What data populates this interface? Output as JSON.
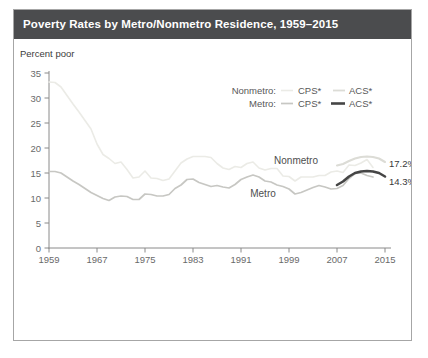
{
  "window": {
    "title": "Poverty Rates by Metro/Nonmetro Residence, 1959–2015"
  },
  "chart": {
    "y_axis_title": "Percent poor",
    "legend": {
      "row1_label": "Nonmetro:",
      "row1_cps": "CPS*",
      "row1_acs": "ACS*",
      "row2_label": "Metro:",
      "row2_cps": "CPS*",
      "row2_acs": "ACS*"
    },
    "annotations": {
      "nonmetro": "Nonmetro",
      "metro": "Metro",
      "nonmetro_end": "17.2%",
      "metro_end": "14.3%"
    }
  },
  "colors": {
    "title_bar_bg": "#4b4c4e",
    "title_text": "#ffffff",
    "panel_border": "#a6a6a6",
    "axis": "#8a8a8a",
    "nonmetro_cps": "#ebebe6",
    "metro_cps": "#c7c7c3",
    "nonmetro_acs": "#dcdcd6",
    "metro_acs": "#454545"
  },
  "chart_data": {
    "type": "line",
    "title": "Poverty Rates by Metro/Nonmetro Residence, 1959–2015",
    "xlabel": "",
    "ylabel": "Percent poor",
    "xlim": [
      1959,
      2015
    ],
    "ylim": [
      0,
      35
    ],
    "yticks": [
      0,
      5,
      10,
      15,
      20,
      25,
      30,
      35
    ],
    "xticks": [
      1959,
      1967,
      1975,
      1983,
      1991,
      1999,
      2007,
      2015
    ],
    "grid": false,
    "legend_position": "top-right",
    "end_labels": {
      "nonmetro_acs": 17.2,
      "metro_acs": 14.3
    },
    "series": [
      {
        "name": "Nonmetro CPS",
        "x_start": 1959,
        "color": "#ebebe6",
        "width": 1.6,
        "values": [
          33.2,
          33.1,
          32.2,
          30.5,
          28.8,
          27.2,
          25.5,
          23.8,
          20.8,
          18.7,
          17.9,
          16.9,
          17.2,
          15.7,
          14.0,
          14.2,
          15.4,
          14.0,
          13.9,
          13.5,
          13.8,
          15.4,
          17.0,
          17.8,
          18.3,
          18.3,
          18.3,
          18.1,
          16.9,
          16.0,
          15.7,
          16.3,
          16.1,
          16.9,
          17.2,
          16.0,
          15.6,
          15.9,
          15.9,
          14.4,
          14.3,
          13.4,
          14.2,
          14.2,
          14.2,
          14.5,
          14.5,
          15.2,
          15.4,
          15.1,
          16.6,
          16.5,
          17.0,
          17.7,
          16.1
        ]
      },
      {
        "name": "Metro CPS",
        "x_start": 1959,
        "color": "#c7c7c3",
        "width": 1.7,
        "values": [
          15.3,
          15.3,
          15.0,
          14.2,
          13.4,
          12.7,
          11.9,
          11.1,
          10.5,
          9.9,
          9.5,
          10.2,
          10.4,
          10.3,
          9.7,
          9.7,
          10.8,
          10.7,
          10.4,
          10.4,
          10.7,
          11.9,
          12.6,
          13.7,
          13.8,
          13.1,
          12.7,
          12.3,
          12.5,
          12.2,
          12.0,
          12.7,
          13.7,
          14.2,
          14.6,
          14.2,
          13.4,
          13.2,
          12.6,
          12.3,
          11.8,
          10.8,
          11.1,
          11.6,
          12.1,
          12.5,
          12.2,
          11.8,
          11.9,
          12.5,
          13.9,
          14.9,
          15.0,
          14.5,
          14.2
        ]
      },
      {
        "name": "Nonmetro ACS",
        "x_start": 2007,
        "color": "#dcdcd6",
        "width": 2.1,
        "values": [
          16.5,
          16.8,
          17.4,
          17.9,
          18.2,
          18.3,
          18.2,
          17.9,
          17.2
        ]
      },
      {
        "name": "Metro ACS",
        "x_start": 2007,
        "color": "#454545",
        "width": 2.6,
        "values": [
          12.6,
          13.3,
          14.3,
          15.0,
          15.3,
          15.4,
          15.3,
          15.0,
          14.3
        ]
      }
    ]
  }
}
